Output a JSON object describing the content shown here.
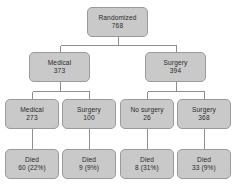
{
  "diagram": {
    "type": "flowchart",
    "style": {
      "box_fill": "#c9c9c9",
      "box_border": "#9a9a9a",
      "connector": "#8f8f8f",
      "text": "#2b2b2b",
      "background": "#ffffff"
    },
    "levels": [
      {
        "level": 0,
        "name": "randomization",
        "nodes": [
          {
            "id": "randomized",
            "label": "Randomized",
            "value": "768",
            "count": 768,
            "x": 87,
            "y": 7,
            "w": 61,
            "h": 30
          }
        ]
      },
      {
        "level": 1,
        "name": "allocated-treatment",
        "nodes": [
          {
            "id": "medical-allocated",
            "label": "Medical",
            "value": "373",
            "count": 373,
            "x": 29,
            "y": 52,
            "w": 61,
            "h": 30
          },
          {
            "id": "surgery-allocated",
            "label": "Surgery",
            "value": "394",
            "count": 394,
            "x": 145,
            "y": 52,
            "w": 61,
            "h": 30
          }
        ]
      },
      {
        "level": 2,
        "name": "received-treatment",
        "nodes": [
          {
            "id": "medical-received",
            "label": "Medical",
            "value": "273",
            "count": 273,
            "x": 5,
            "y": 99,
            "w": 54,
            "h": 30
          },
          {
            "id": "surgery-crossover",
            "label": "Surgery",
            "value": "100",
            "count": 100,
            "x": 62,
            "y": 99,
            "w": 54,
            "h": 30
          },
          {
            "id": "no-surgery",
            "label": "No surgery",
            "value": "26",
            "count": 26,
            "x": 120,
            "y": 99,
            "w": 54,
            "h": 30
          },
          {
            "id": "surgery-received",
            "label": "Surgery",
            "value": "368",
            "count": 368,
            "x": 177,
            "y": 99,
            "w": 54,
            "h": 30
          }
        ]
      },
      {
        "level": 3,
        "name": "outcomes-died",
        "nodes": [
          {
            "id": "died-medical-received",
            "label": "Died",
            "value": "60 (22%)",
            "count": 60,
            "percent": 22,
            "x": 5,
            "y": 149,
            "w": 54,
            "h": 30
          },
          {
            "id": "died-surgery-crossover",
            "label": "Died",
            "value": "9 (9%)",
            "count": 9,
            "percent": 9,
            "x": 62,
            "y": 149,
            "w": 54,
            "h": 30
          },
          {
            "id": "died-no-surgery",
            "label": "Died",
            "value": "8 (31%)",
            "count": 8,
            "percent": 31,
            "x": 120,
            "y": 149,
            "w": 54,
            "h": 30
          },
          {
            "id": "died-surgery-received",
            "label": "Died",
            "value": "33 (9%)",
            "count": 33,
            "percent": 9,
            "x": 177,
            "y": 149,
            "w": 54,
            "h": 30
          }
        ]
      }
    ],
    "edges": [
      {
        "from": "randomized",
        "to": "medical-allocated"
      },
      {
        "from": "randomized",
        "to": "surgery-allocated"
      },
      {
        "from": "medical-allocated",
        "to": "medical-received"
      },
      {
        "from": "medical-allocated",
        "to": "surgery-crossover"
      },
      {
        "from": "surgery-allocated",
        "to": "no-surgery"
      },
      {
        "from": "surgery-allocated",
        "to": "surgery-received"
      },
      {
        "from": "medical-received",
        "to": "died-medical-received"
      },
      {
        "from": "surgery-crossover",
        "to": "died-surgery-crossover"
      },
      {
        "from": "no-surgery",
        "to": "died-no-surgery"
      },
      {
        "from": "surgery-received",
        "to": "died-surgery-received"
      }
    ]
  }
}
